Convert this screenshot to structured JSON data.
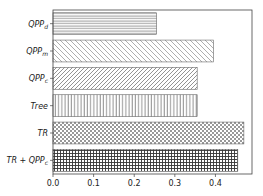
{
  "chart_data": {
    "type": "bar",
    "orientation": "horizontal",
    "title": "",
    "xlabel": "",
    "ylabel": "",
    "categories": [
      "QPP_d",
      "QPP_m",
      "QPP_c",
      "Tree",
      "TR",
      "TR + QPP_c"
    ],
    "category_display": [
      {
        "base": "QPP",
        "sub": "d"
      },
      {
        "base": "QPP",
        "sub": "m"
      },
      {
        "base": "QPP",
        "sub": "c"
      },
      {
        "base": "Tree",
        "sub": ""
      },
      {
        "base": "TR",
        "sub": ""
      },
      {
        "base": "TR + QPP",
        "sub": "c"
      }
    ],
    "values": [
      0.255,
      0.395,
      0.355,
      0.355,
      0.47,
      0.455
    ],
    "hatches": [
      "horizontal",
      "diagonal-back",
      "diagonal-forward",
      "vertical",
      "checker",
      "grid"
    ],
    "xlim": [
      0.0,
      0.49
    ],
    "xticks": [
      "0.0",
      "0.1",
      "0.2",
      "0.3",
      "0.4"
    ],
    "xtick_values": [
      0.0,
      0.1,
      0.2,
      0.3,
      0.4
    ],
    "grid": false,
    "legend": null
  },
  "colors": {
    "bar_fill": "#ffffff",
    "hatch": "#555555",
    "hatch_dark": "#333333",
    "axis": "#444444"
  }
}
